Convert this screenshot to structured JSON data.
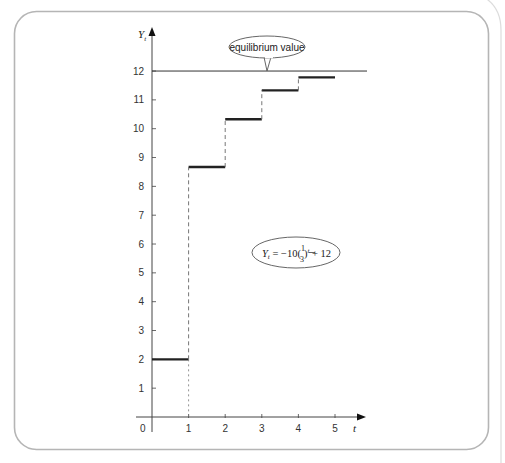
{
  "chart_data": {
    "type": "line",
    "subtype": "step",
    "title": "",
    "xlabel": "t",
    "ylabel": "Y_t",
    "xlim": [
      0,
      5
    ],
    "ylim": [
      0,
      12
    ],
    "x_ticks": [
      0,
      1,
      2,
      3,
      4,
      5
    ],
    "y_ticks": [
      1,
      2,
      3,
      4,
      5,
      6,
      7,
      8,
      9,
      10,
      11,
      12
    ],
    "grid": false,
    "legend": null,
    "series": [
      {
        "name": "Y_t",
        "formula": "Y_t = -10(1/3)^t + 12",
        "steps": [
          {
            "t_start": 0,
            "t_end": 1,
            "value": 2.0
          },
          {
            "t_start": 1,
            "t_end": 2,
            "value": 8.67
          },
          {
            "t_start": 2,
            "t_end": 3,
            "value": 10.33
          },
          {
            "t_start": 3,
            "t_end": 4,
            "value": 11.33
          },
          {
            "t_start": 4,
            "t_end": 5,
            "value": 11.78
          }
        ]
      }
    ],
    "reference_lines": [
      {
        "type": "horizontal",
        "y": 12,
        "label": "equilibrium value"
      }
    ],
    "annotations": [
      {
        "text": "equilibrium value",
        "kind": "callout",
        "points_to": {
          "t": 3.1,
          "y": 12
        }
      },
      {
        "text": "Y_t = -10(1/3)^t + 12",
        "kind": "formula-ellipse",
        "at": {
          "t": 3.6,
          "y": 6.0
        }
      }
    ]
  },
  "labels": {
    "y_axis": "Y",
    "y_axis_sub": "t",
    "x_axis": "t",
    "origin": "0",
    "equilibrium": "equilibrium value",
    "formula_lhs": "Y",
    "formula_lhs_sub": "t",
    "formula_eq": " = −10(",
    "formula_num": "1",
    "formula_den": "3",
    "formula_close": ")",
    "formula_exp": "t",
    "formula_tail": " + 12"
  },
  "colors": {
    "frame": "#b5b5b5",
    "axis": "#444444",
    "step": "#222222",
    "dash": "#777777",
    "equilibrium_line": "#333333"
  }
}
